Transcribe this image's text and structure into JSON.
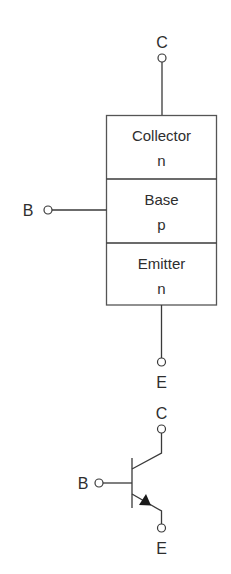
{
  "diagram": {
    "type": "npn-bjt-structure",
    "block": {
      "terminals": {
        "collector": "C",
        "base": "B",
        "emitter": "E"
      },
      "regions": [
        {
          "name": "Collector",
          "doping": "n"
        },
        {
          "name": "Base",
          "doping": "p"
        },
        {
          "name": "Emitter",
          "doping": "n"
        }
      ]
    },
    "symbol": {
      "terminals": {
        "collector": "C",
        "base": "B",
        "emitter": "E"
      },
      "arrow_direction": "emitter-outward"
    },
    "colors": {
      "line": "#3a3a3a",
      "text": "#2e2e2e",
      "background": "#ffffff"
    }
  }
}
